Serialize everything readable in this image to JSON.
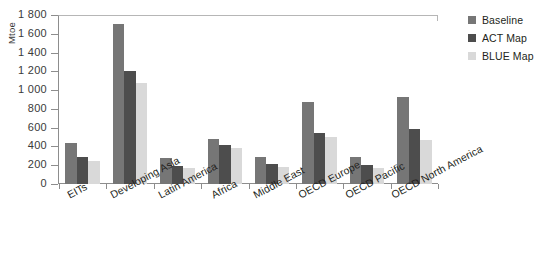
{
  "chart_data": {
    "type": "bar",
    "title": "",
    "xlabel": "",
    "ylabel": "Mtoe",
    "ylim": [
      0,
      1800
    ],
    "yticks": [
      0,
      200,
      400,
      600,
      800,
      1000,
      1200,
      1400,
      1600,
      1800
    ],
    "ytick_labels": [
      "0",
      "200",
      "400",
      "600",
      "800",
      "1 000",
      "1 200",
      "1 400",
      "1 600",
      "1 800"
    ],
    "grid": false,
    "legend_position": "right",
    "categories": [
      "EITs",
      "Developing Asia",
      "Latin America",
      "Africa",
      "Middle East",
      "OECD Europe",
      "OECD Pacific",
      "OECD North America"
    ],
    "series": [
      {
        "name": "Baseline",
        "color": "#767676",
        "values": [
          440,
          1700,
          275,
          480,
          290,
          870,
          290,
          925
        ]
      },
      {
        "name": "ACT Map",
        "color": "#4d4d4d",
        "values": [
          290,
          1205,
          195,
          420,
          215,
          545,
          200,
          590
        ]
      },
      {
        "name": "BLUE Map",
        "color": "#d9d9d9",
        "values": [
          250,
          1075,
          170,
          380,
          185,
          500,
          175,
          470
        ]
      }
    ]
  },
  "axis": {
    "y_title": "Mtoe"
  },
  "legend": {
    "entries": [
      {
        "label": "Baseline",
        "color": "#767676"
      },
      {
        "label": "ACT Map",
        "color": "#4d4d4d"
      },
      {
        "label": "BLUE Map",
        "color": "#d9d9d9"
      }
    ]
  }
}
